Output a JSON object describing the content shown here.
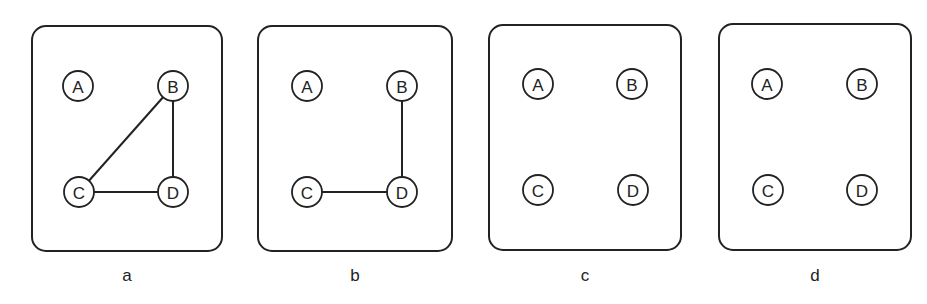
{
  "panels": [
    {
      "label": "a",
      "box": {
        "x": 32,
        "y": 26,
        "w": 190,
        "h": 225
      },
      "nodes": {
        "A": [
          78,
          86
        ],
        "B": [
          173,
          86
        ],
        "C": [
          79,
          192
        ],
        "D": [
          173,
          192
        ]
      },
      "edges": [
        [
          "B",
          "C"
        ],
        [
          "B",
          "D"
        ],
        [
          "C",
          "D"
        ]
      ]
    },
    {
      "label": "b",
      "box": {
        "x": 258,
        "y": 26,
        "w": 194,
        "h": 225
      },
      "nodes": {
        "A": [
          307,
          86
        ],
        "B": [
          402,
          86
        ],
        "C": [
          307,
          192
        ],
        "D": [
          402,
          192
        ]
      },
      "edges": [
        [
          "B",
          "D"
        ],
        [
          "C",
          "D"
        ]
      ]
    },
    {
      "label": "c",
      "box": {
        "x": 489,
        "y": 25,
        "w": 192,
        "h": 225
      },
      "nodes": {
        "A": [
          538,
          84
        ],
        "B": [
          632,
          84
        ],
        "C": [
          538,
          190
        ],
        "D": [
          633,
          190
        ]
      },
      "edges": []
    },
    {
      "label": "d",
      "box": {
        "x": 719,
        "y": 24,
        "w": 192,
        "h": 226
      },
      "nodes": {
        "A": [
          767,
          84
        ],
        "B": [
          862,
          84
        ],
        "C": [
          768,
          190
        ],
        "D": [
          862,
          190
        ]
      },
      "edges": []
    }
  ],
  "node_names": [
    "A",
    "B",
    "C",
    "D"
  ],
  "node_radius": 15,
  "panel_label_y": 281
}
